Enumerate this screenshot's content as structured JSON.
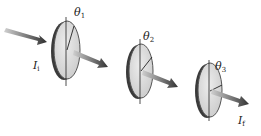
{
  "diagram": {
    "colors": {
      "disk_face": "#d9d9d9",
      "disk_rim": "#555555",
      "disk_edge_dark": "#333333",
      "arrow": "#3a3a3a",
      "arrow_fade": "#c8c8c8",
      "axis_line": "#222222"
    },
    "incident_label": {
      "symbol": "I",
      "subscript": "i"
    },
    "final_label": {
      "symbol": "I",
      "subscript": "f"
    },
    "polarizers": [
      {
        "id": 1,
        "angle_label": {
          "symbol": "θ",
          "subscript": "1"
        }
      },
      {
        "id": 2,
        "angle_label": {
          "symbol": "θ",
          "subscript": "2"
        }
      },
      {
        "id": 3,
        "angle_label": {
          "symbol": "θ",
          "subscript": "3"
        }
      }
    ]
  }
}
